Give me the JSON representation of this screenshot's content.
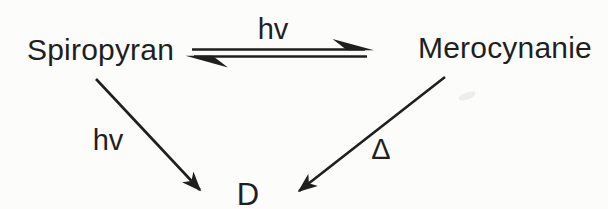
{
  "scene": {
    "ink_color": "#1f1f1f",
    "background_color": "#fcfcfa"
  },
  "nodes": {
    "spiropyran": "Spiropyran",
    "merocyanine": "Merocynanie",
    "product": "D"
  },
  "labels": {
    "equilibrium_top": "hv",
    "spiropyran_to_product": "hv",
    "merocyanine_to_product": "Δ"
  }
}
